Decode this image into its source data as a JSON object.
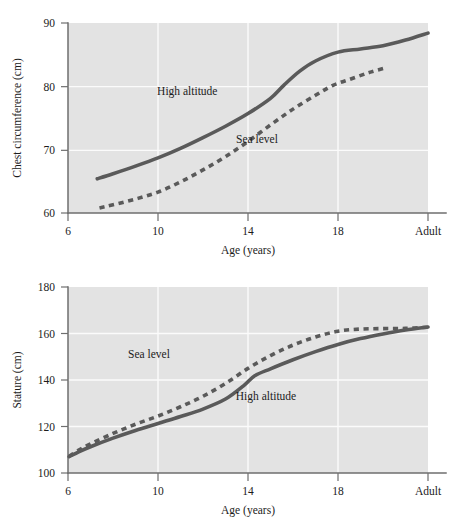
{
  "figure": {
    "background_color": "#ffffff",
    "plot_background_color": "#e3e3e3",
    "gridline_color": "#fbfbfb",
    "line_color": "#5a5a5a",
    "axis_color": "#6e6e6e"
  },
  "chart_data": [
    {
      "id": "chest-circumference",
      "type": "line",
      "title": "",
      "xlabel": "Age (years)",
      "ylabel": "Chest circumference (cm)",
      "xtick_labels": [
        "6",
        "10",
        "14",
        "18",
        "Adult"
      ],
      "xtick_values": [
        6,
        10,
        14,
        18,
        22
      ],
      "ytick_labels": [
        "60",
        "70",
        "80",
        "90"
      ],
      "ytick_values": [
        60,
        70,
        80,
        90
      ],
      "xlim": [
        6,
        22
      ],
      "ylim": [
        60,
        90
      ],
      "grid": true,
      "legend_position": "inline-annotations",
      "series": [
        {
          "name": "High altitude",
          "style": "solid",
          "label_x": 11.3,
          "label_y": 78.6,
          "x": [
            7.3,
            8,
            9,
            10,
            11,
            12,
            13,
            14,
            15,
            15.6,
            16.3,
            17,
            18,
            19,
            20,
            21,
            22
          ],
          "values": [
            65.4,
            66.2,
            67.4,
            68.7,
            70.2,
            71.9,
            73.7,
            75.7,
            78.1,
            80.2,
            82.4,
            84.0,
            85.4,
            85.9,
            86.4,
            87.3,
            88.4
          ]
        },
        {
          "name": "Sea level",
          "style": "dashed",
          "label_x": 14.4,
          "label_y": 71.1,
          "x": [
            7.4,
            8,
            9,
            10,
            11,
            12,
            13,
            14,
            15,
            16,
            17,
            17.8,
            18.6,
            19.4,
            20.1
          ],
          "values": [
            60.8,
            61.3,
            62.2,
            63.3,
            64.9,
            66.8,
            68.9,
            71.3,
            73.9,
            76.4,
            78.6,
            80.2,
            81.2,
            82.2,
            82.9
          ]
        }
      ]
    },
    {
      "id": "stature",
      "type": "line",
      "title": "",
      "xlabel": "Age (years)",
      "ylabel": "Stature (cm)",
      "xtick_labels": [
        "6",
        "10",
        "14",
        "18",
        "Adult"
      ],
      "xtick_values": [
        6,
        10,
        14,
        18,
        22
      ],
      "ytick_labels": [
        "100",
        "120",
        "140",
        "160",
        "180"
      ],
      "ytick_values": [
        100,
        120,
        140,
        160,
        180
      ],
      "xlim": [
        6,
        22
      ],
      "ylim": [
        100,
        180
      ],
      "grid": true,
      "legend_position": "inline-annotations",
      "series": [
        {
          "name": "Sea level",
          "style": "dashed",
          "label_x": 9.6,
          "label_y": 149.5,
          "x": [
            6.05,
            6.5,
            7,
            8,
            9,
            10,
            11,
            12,
            13,
            14,
            15,
            16,
            17,
            18,
            19,
            20,
            21,
            22
          ],
          "values": [
            107.2,
            110.0,
            112.5,
            117.0,
            121.0,
            124.5,
            128.5,
            133.0,
            138.5,
            145.0,
            150.5,
            155.0,
            158.5,
            161.0,
            161.9,
            162.1,
            162.2,
            162.7
          ]
        },
        {
          "name": "High altitude",
          "style": "solid",
          "label_x": 14.8,
          "label_y": 131.5,
          "x": [
            6.05,
            6.5,
            7,
            8,
            9,
            10,
            11,
            12,
            13,
            13.8,
            14.3,
            15,
            16,
            17,
            18,
            19,
            20,
            21,
            22
          ],
          "values": [
            107.0,
            109.2,
            111.3,
            115.0,
            118.3,
            121.3,
            124.3,
            127.5,
            131.8,
            137.5,
            141.8,
            144.8,
            148.7,
            152.2,
            155.3,
            157.8,
            159.8,
            161.5,
            162.8
          ]
        }
      ]
    }
  ]
}
